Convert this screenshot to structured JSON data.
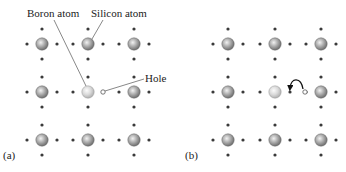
{
  "figure": {
    "panels": [
      {
        "id": "a",
        "label": "(a)",
        "annotations": {
          "boron_label": "Boron atom",
          "silicon_label": "Silicon atom",
          "hole_label": "Hole"
        },
        "lattice": {
          "rows": 3,
          "cols": 3
        },
        "boron_position": {
          "row": 1,
          "col": 1
        },
        "hole": {
          "row": 1,
          "between_cols": [
            1,
            2
          ],
          "side": "left"
        }
      },
      {
        "id": "b",
        "label": "(b)",
        "lattice": {
          "rows": 3,
          "cols": 3
        },
        "boron_position": {
          "row": 1,
          "col": 1
        },
        "hole": {
          "row": 1,
          "between_cols": [
            1,
            2
          ],
          "side": "right"
        },
        "electron_moved": {
          "row": 1,
          "between_cols": [
            1,
            2
          ],
          "side": "left"
        },
        "arrow": "curved-arrow from neighbor bond electron into hole"
      }
    ],
    "colors": {
      "silicon": "#8a8a8a",
      "boron": "#c8c8c8",
      "electron_dot": "#3a3a3a",
      "hole_outline": "#555555"
    }
  }
}
